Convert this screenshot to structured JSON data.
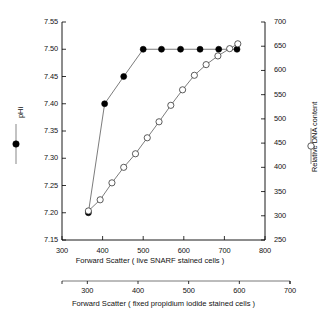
{
  "chart_data": {
    "type": "line",
    "title": "",
    "subtitle": "",
    "grid": false,
    "legend_position": "outside-left-and-right-axis-labels",
    "xlabel": "Forward Scatter ( live SNARF stained cells )",
    "xlabel_secondary": "Forward Scatter ( fixed propidium iodide stained cells )",
    "ylabel_left": "pHi",
    "ylabel_right": "Relative DNA content",
    "xlim": [
      300,
      800
    ],
    "xticks": [
      300,
      400,
      500,
      600,
      700,
      800
    ],
    "xlim_secondary": [
      250,
      700
    ],
    "xticks_secondary": [
      300,
      400,
      500,
      600,
      700
    ],
    "ylim_left": [
      7.15,
      7.55
    ],
    "yticks_left": [
      "7.15",
      "7.20",
      "7.25",
      "7.30",
      "7.35",
      "7.40",
      "7.45",
      "7.50",
      "7.55"
    ],
    "ylim_right": [
      250,
      700
    ],
    "yticks_right": [
      250,
      300,
      350,
      400,
      450,
      500,
      550,
      600,
      650,
      700
    ],
    "series": [
      {
        "name": "pHi",
        "marker": "filled-circle",
        "axis": "left",
        "x": [
          365,
          405,
          452,
          500,
          545,
          592,
          640,
          686,
          731
        ],
        "values": [
          7.2,
          7.4,
          7.45,
          7.5,
          7.5,
          7.5,
          7.5,
          7.5,
          7.5
        ]
      },
      {
        "name": "Relative DNA content",
        "marker": "open-circle",
        "axis": "right",
        "x": [
          365,
          394,
          423,
          452,
          481,
          510,
          539,
          568,
          597,
          626,
          655,
          684,
          713,
          733
        ],
        "values": [
          310,
          333,
          368,
          400,
          428,
          461,
          494,
          528,
          560,
          590,
          612,
          630,
          645,
          655
        ]
      }
    ]
  },
  "axis_labels": {
    "left_legend_text": "pHi",
    "right_legend_text": "Relative DNA content"
  }
}
